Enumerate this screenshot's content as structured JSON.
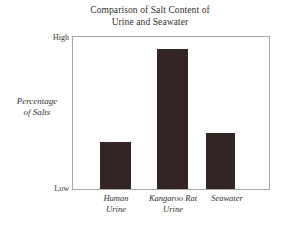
{
  "chart_data": {
    "type": "bar",
    "title": "Comparison of Salt Content of Urine and Seawater",
    "title_lines": [
      "Comparison of Salt Content of",
      "Urine and Seawater"
    ],
    "xlabel": "",
    "ylabel": "Percentage of Salts",
    "ylabel_lines": [
      "Percentage",
      "of Salts"
    ],
    "categories": [
      "Human Urine",
      "Kangaroo Rat Urine",
      "Seawater"
    ],
    "category_lines": [
      [
        "Human",
        "Urine"
      ],
      [
        "Kangaroo Rat",
        "Urine"
      ],
      [
        "Seawater"
      ]
    ],
    "values": [
      31,
      92,
      37
    ],
    "ylim": [
      0,
      100
    ],
    "ytick_labels": [
      "Low",
      "High"
    ],
    "ytick_values": [
      0,
      100
    ],
    "y_axis_qualitative": true,
    "grid": false,
    "legend": false,
    "bar_color": "#332523",
    "frame_color": "#a8a5a2",
    "background_color": "#ffffff"
  }
}
